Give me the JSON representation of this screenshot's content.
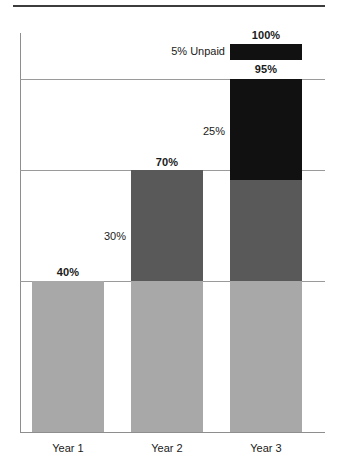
{
  "chart_data": {
    "type": "bar",
    "subtype": "stacked-bar",
    "title": "",
    "subtitle": "",
    "xlabel": "",
    "ylabel": "",
    "ylim": [
      0,
      100
    ],
    "grid": true,
    "gridlines": [
      40,
      70,
      95
    ],
    "legend_position": "none",
    "categories": [
      "Year 1",
      "Year 2",
      "Year 3"
    ],
    "series": [
      {
        "name": "Base",
        "color": "#a8a8a8",
        "values": [
          40,
          40,
          40
        ]
      },
      {
        "name": "Increment",
        "color": "#595959",
        "values": [
          0,
          30,
          25
        ]
      },
      {
        "name": "Additional",
        "color": "#111111",
        "values": [
          0,
          0,
          30
        ]
      },
      {
        "name": "Unpaid",
        "color": "#111111",
        "values": [
          0,
          0,
          5
        ]
      }
    ],
    "totals": [
      40,
      70,
      95
    ],
    "totals_with_unpaid": [
      40,
      70,
      100
    ],
    "annotations": [
      {
        "text": "40%",
        "bold": true,
        "category": "Year 1",
        "value": 40
      },
      {
        "text": "70%",
        "bold": true,
        "category": "Year 2",
        "value": 70
      },
      {
        "text": "95%",
        "bold": true,
        "category": "Year 3",
        "value": 95
      },
      {
        "text": "100%",
        "bold": true,
        "category": "Year 3",
        "value": 100
      },
      {
        "text": "30%",
        "bold": false,
        "category": "Year 2",
        "value": 30
      },
      {
        "text": "25%",
        "bold": false,
        "category": "Year 3",
        "value": 25
      },
      {
        "text": "5% Unpaid",
        "bold": false,
        "category": "Year 3",
        "value": 5
      }
    ]
  },
  "labels": {
    "total_year1": "40%",
    "total_year2": "70%",
    "total_year3": "95%",
    "total_year3_with_unpaid": "100%",
    "segment_year2_increment": "30%",
    "segment_year3_increment": "25%",
    "segment_year3_unpaid": "5% Unpaid"
  },
  "categories": {
    "year1": "Year 1",
    "year2": "Year 2",
    "year3": "Year 3"
  },
  "colors": {
    "base": "#a8a8a8",
    "increment": "#595959",
    "additional": "#111111",
    "unpaid": "#111111",
    "axis": "#8e8e8e",
    "gridline": "#9a9a9a",
    "top_rule": "#3c3c3c",
    "text": "#1a1a1a"
  }
}
